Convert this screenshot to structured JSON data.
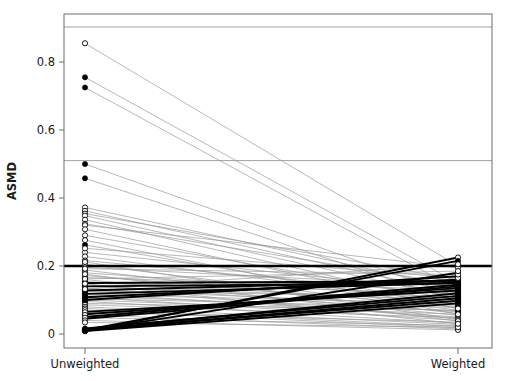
{
  "chart_data": {
    "type": "line",
    "title": "",
    "subtitle": "",
    "xlabel": "",
    "ylabel": "ASMD",
    "categories": [
      "Unweighted",
      "Weighted"
    ],
    "xtick_labels": [
      "Unweighted",
      "Weighted"
    ],
    "ytick_labels": [
      "0",
      "0.2",
      "0.4",
      "0.6",
      "0.8"
    ],
    "ytick_values": [
      0,
      0.2,
      0.4,
      0.6,
      0.8
    ],
    "ylim": [
      -0.04,
      0.983
    ],
    "xlim": [
      0,
      1
    ],
    "grid": false,
    "legend": "none",
    "reference_lines": [
      {
        "name": "threshold-line",
        "value": 0.2,
        "style": "thick-solid-black",
        "width": 2.6,
        "color": "#000000"
      },
      {
        "name": "gridline-mid",
        "value": 0.51,
        "style": "thin-solid-gray",
        "width": 0.8,
        "color": "#8a8a8a"
      },
      {
        "name": "gridline-upper",
        "value": 0.903,
        "style": "thin-solid-gray",
        "width": 0.8,
        "color": "#8a8a8a"
      }
    ],
    "marker_styles": {
      "open": "open-circle",
      "filled": "filled-circle"
    },
    "line_styles": {
      "decreasing": {
        "color": "#9a9a9a",
        "width": 0.7
      },
      "increasing": {
        "color": "#000000",
        "width": 1.9
      }
    },
    "series": [
      {
        "name": "cov-01",
        "marker": "open",
        "trend": "decreasing",
        "values": [
          0.855,
          0.2
        ]
      },
      {
        "name": "cov-02",
        "marker": "filled",
        "trend": "decreasing",
        "values": [
          0.755,
          0.15
        ]
      },
      {
        "name": "cov-03",
        "marker": "filled",
        "trend": "decreasing",
        "values": [
          0.725,
          0.13
        ]
      },
      {
        "name": "cov-04",
        "marker": "filled",
        "trend": "decreasing",
        "values": [
          0.5,
          0.11
        ]
      },
      {
        "name": "cov-05",
        "marker": "filled",
        "trend": "decreasing",
        "values": [
          0.458,
          0.095
        ]
      },
      {
        "name": "cov-06",
        "marker": "open",
        "trend": "decreasing",
        "values": [
          0.372,
          0.135
        ]
      },
      {
        "name": "cov-07",
        "marker": "open",
        "trend": "decreasing",
        "values": [
          0.362,
          0.12
        ]
      },
      {
        "name": "cov-08",
        "marker": "open",
        "trend": "decreasing",
        "values": [
          0.354,
          0.16
        ]
      },
      {
        "name": "cov-09",
        "marker": "open",
        "trend": "decreasing",
        "values": [
          0.348,
          0.105
        ]
      },
      {
        "name": "cov-10",
        "marker": "open",
        "trend": "decreasing",
        "values": [
          0.336,
          0.085
        ]
      },
      {
        "name": "cov-11",
        "marker": "open",
        "trend": "decreasing",
        "values": [
          0.324,
          0.145
        ]
      },
      {
        "name": "cov-12",
        "marker": "open",
        "trend": "decreasing",
        "values": [
          0.29,
          0.1
        ]
      },
      {
        "name": "cov-13",
        "marker": "filled",
        "trend": "decreasing",
        "values": [
          0.262,
          0.075
        ]
      },
      {
        "name": "cov-14",
        "marker": "open",
        "trend": "decreasing",
        "values": [
          0.24,
          0.125
        ]
      },
      {
        "name": "cov-15",
        "marker": "open",
        "trend": "decreasing",
        "values": [
          0.228,
          0.09
        ]
      },
      {
        "name": "cov-16",
        "marker": "open",
        "trend": "decreasing",
        "values": [
          0.216,
          0.115
        ]
      },
      {
        "name": "cov-17",
        "marker": "open",
        "trend": "decreasing",
        "values": [
          0.205,
          0.07
        ]
      },
      {
        "name": "cov-18",
        "marker": "open",
        "trend": "decreasing",
        "values": [
          0.196,
          0.14
        ]
      },
      {
        "name": "cov-19",
        "marker": "open",
        "trend": "decreasing",
        "values": [
          0.188,
          0.06
        ]
      },
      {
        "name": "cov-20",
        "marker": "open",
        "trend": "decreasing",
        "values": [
          0.18,
          0.105
        ]
      },
      {
        "name": "cov-21",
        "marker": "open",
        "trend": "decreasing",
        "values": [
          0.172,
          0.08
        ]
      },
      {
        "name": "cov-22",
        "marker": "open",
        "trend": "decreasing",
        "values": [
          0.166,
          0.13
        ]
      },
      {
        "name": "cov-23",
        "marker": "filled",
        "trend": "decreasing",
        "values": [
          0.16,
          0.055
        ]
      },
      {
        "name": "cov-24",
        "marker": "open",
        "trend": "decreasing",
        "values": [
          0.154,
          0.095
        ]
      },
      {
        "name": "cov-25",
        "marker": "filled",
        "trend": "decreasing",
        "values": [
          0.15,
          0.12
        ]
      },
      {
        "name": "cov-26",
        "marker": "open",
        "trend": "decreasing",
        "values": [
          0.145,
          0.065
        ]
      },
      {
        "name": "cov-27",
        "marker": "filled",
        "trend": "decreasing",
        "values": [
          0.14,
          0.1
        ]
      },
      {
        "name": "cov-28",
        "marker": "open",
        "trend": "decreasing",
        "values": [
          0.135,
          0.045
        ]
      },
      {
        "name": "cov-29",
        "marker": "filled",
        "trend": "decreasing",
        "values": [
          0.13,
          0.085
        ]
      },
      {
        "name": "cov-30",
        "marker": "open",
        "trend": "decreasing",
        "values": [
          0.126,
          0.11
        ]
      },
      {
        "name": "cov-31",
        "marker": "filled",
        "trend": "decreasing",
        "values": [
          0.12,
          0.05
        ]
      },
      {
        "name": "cov-32",
        "marker": "open",
        "trend": "decreasing",
        "values": [
          0.116,
          0.09
        ]
      },
      {
        "name": "cov-33",
        "marker": "filled",
        "trend": "decreasing",
        "values": [
          0.112,
          0.068
        ]
      },
      {
        "name": "cov-34",
        "marker": "open",
        "trend": "decreasing",
        "values": [
          0.108,
          0.04
        ]
      },
      {
        "name": "cov-35",
        "marker": "filled",
        "trend": "decreasing",
        "values": [
          0.104,
          0.078
        ]
      },
      {
        "name": "cov-36",
        "marker": "open",
        "trend": "decreasing",
        "values": [
          0.1,
          0.058
        ]
      },
      {
        "name": "cov-37",
        "marker": "open",
        "trend": "decreasing",
        "values": [
          0.096,
          0.032
        ]
      },
      {
        "name": "cov-38",
        "marker": "filled",
        "trend": "decreasing",
        "values": [
          0.09,
          0.07
        ]
      },
      {
        "name": "cov-39",
        "marker": "open",
        "trend": "decreasing",
        "values": [
          0.086,
          0.048
        ]
      },
      {
        "name": "cov-40",
        "marker": "open",
        "trend": "decreasing",
        "values": [
          0.08,
          0.028
        ]
      },
      {
        "name": "cov-41",
        "marker": "open",
        "trend": "increasing",
        "values": [
          0.008,
          0.225
        ]
      },
      {
        "name": "cov-42",
        "marker": "filled",
        "trend": "increasing",
        "values": [
          0.012,
          0.215
        ]
      },
      {
        "name": "cov-43",
        "marker": "filled",
        "trend": "increasing",
        "values": [
          0.01,
          0.18
        ]
      },
      {
        "name": "cov-44",
        "marker": "filled",
        "trend": "increasing",
        "values": [
          0.1,
          0.17
        ]
      },
      {
        "name": "cov-45",
        "marker": "filled",
        "trend": "increasing",
        "values": [
          0.108,
          0.16
        ]
      },
      {
        "name": "cov-46",
        "marker": "filled",
        "trend": "increasing",
        "values": [
          0.15,
          0.155
        ]
      },
      {
        "name": "cov-47",
        "marker": "filled",
        "trend": "increasing",
        "values": [
          0.14,
          0.15
        ]
      },
      {
        "name": "cov-48",
        "marker": "filled",
        "trend": "increasing",
        "values": [
          0.05,
          0.145
        ]
      },
      {
        "name": "cov-49",
        "marker": "filled",
        "trend": "increasing",
        "values": [
          0.045,
          0.14
        ]
      },
      {
        "name": "cov-50",
        "marker": "filled",
        "trend": "increasing",
        "values": [
          0.058,
          0.135
        ]
      },
      {
        "name": "cov-51",
        "marker": "filled",
        "trend": "increasing",
        "values": [
          0.065,
          0.128
        ]
      },
      {
        "name": "cov-52",
        "marker": "filled",
        "trend": "increasing",
        "values": [
          0.014,
          0.12
        ]
      },
      {
        "name": "cov-53",
        "marker": "filled",
        "trend": "increasing",
        "values": [
          0.016,
          0.112
        ]
      },
      {
        "name": "cov-54",
        "marker": "filled",
        "trend": "increasing",
        "values": [
          0.011,
          0.105
        ]
      },
      {
        "name": "cov-55",
        "marker": "filled",
        "trend": "increasing",
        "values": [
          0.013,
          0.098
        ]
      },
      {
        "name": "cov-56",
        "marker": "filled",
        "trend": "increasing",
        "values": [
          0.009,
          0.09
        ]
      },
      {
        "name": "cov-57",
        "marker": "filled",
        "trend": "increasing",
        "values": [
          0.118,
          0.15
        ]
      },
      {
        "name": "cov-58",
        "marker": "filled",
        "trend": "increasing",
        "values": [
          0.128,
          0.158
        ]
      },
      {
        "name": "cov-59",
        "marker": "open",
        "trend": "decreasing",
        "values": [
          0.075,
          0.022
        ]
      },
      {
        "name": "cov-60",
        "marker": "open",
        "trend": "decreasing",
        "values": [
          0.07,
          0.018
        ]
      },
      {
        "name": "cov-61",
        "marker": "open",
        "trend": "decreasing",
        "values": [
          0.064,
          0.035
        ]
      },
      {
        "name": "cov-62",
        "marker": "open",
        "trend": "decreasing",
        "values": [
          0.056,
          0.015
        ]
      },
      {
        "name": "cov-63",
        "marker": "open",
        "trend": "decreasing",
        "values": [
          0.048,
          0.025
        ]
      },
      {
        "name": "cov-64",
        "marker": "open",
        "trend": "decreasing",
        "values": [
          0.04,
          0.012
        ]
      },
      {
        "name": "cov-65",
        "marker": "open",
        "trend": "decreasing",
        "values": [
          0.034,
          0.02
        ]
      },
      {
        "name": "cov-66",
        "marker": "open",
        "trend": "decreasing",
        "values": [
          0.32,
          0.195
        ]
      },
      {
        "name": "cov-67",
        "marker": "open",
        "trend": "decreasing",
        "values": [
          0.308,
          0.075
        ]
      },
      {
        "name": "cov-68",
        "marker": "open",
        "trend": "decreasing",
        "values": [
          0.276,
          0.058
        ]
      },
      {
        "name": "cov-69",
        "marker": "open",
        "trend": "decreasing",
        "values": [
          0.252,
          0.165
        ]
      },
      {
        "name": "cov-70",
        "marker": "open",
        "trend": "decreasing",
        "values": [
          0.212,
          0.042
        ]
      },
      {
        "name": "cov-71",
        "marker": "open",
        "trend": "decreasing",
        "values": [
          0.192,
          0.175
        ]
      },
      {
        "name": "cov-72",
        "marker": "open",
        "trend": "decreasing",
        "values": [
          0.176,
          0.038
        ]
      },
      {
        "name": "cov-73",
        "marker": "open",
        "trend": "decreasing",
        "values": [
          0.162,
          0.185
        ]
      },
      {
        "name": "cov-74",
        "marker": "open",
        "trend": "decreasing",
        "values": [
          0.148,
          0.03
        ]
      },
      {
        "name": "cov-75",
        "marker": "open",
        "trend": "decreasing",
        "values": [
          0.132,
          0.205
        ]
      }
    ]
  },
  "plot_geometry": {
    "frame_left": 64,
    "frame_right": 492,
    "frame_top": 14,
    "frame_bottom": 348,
    "x_unweighted": 85,
    "x_weighted": 458,
    "y_at_zero": 334,
    "pixels_per_unit": 340
  }
}
